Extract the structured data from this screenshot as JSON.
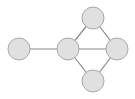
{
  "diagram": {
    "type": "graph",
    "node_fill": "#e0e0e0",
    "node_stroke": "#a8a8a8",
    "edge_color": "#888888",
    "nodes": [
      {
        "id": "n1",
        "cx": 19,
        "cy": 49,
        "r": 11
      },
      {
        "id": "n2",
        "cx": 68,
        "cy": 49,
        "r": 11
      },
      {
        "id": "n3",
        "cx": 93,
        "cy": 18,
        "r": 11
      },
      {
        "id": "n4",
        "cx": 117,
        "cy": 49,
        "r": 11
      },
      {
        "id": "n5",
        "cx": 93,
        "cy": 81,
        "r": 11
      }
    ],
    "edges": [
      {
        "from": "n1",
        "to": "n2"
      },
      {
        "from": "n2",
        "to": "n3"
      },
      {
        "from": "n2",
        "to": "n4"
      },
      {
        "from": "n2",
        "to": "n5"
      },
      {
        "from": "n3",
        "to": "n4"
      },
      {
        "from": "n4",
        "to": "n5"
      }
    ]
  }
}
